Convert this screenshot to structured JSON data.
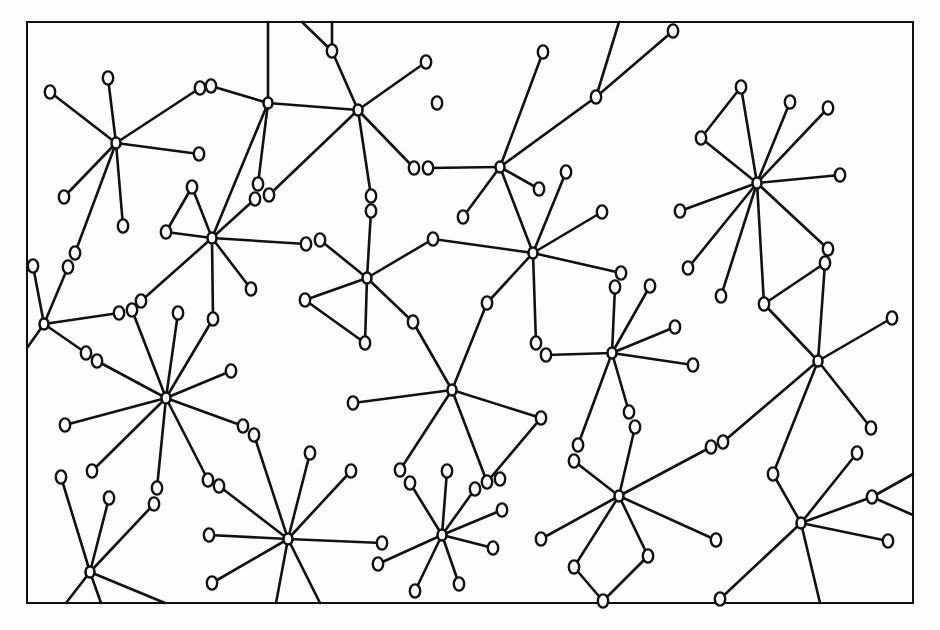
{
  "diagram": {
    "title": "",
    "type": "network-graph",
    "frame": {
      "x": 27,
      "y": 22,
      "width": 886,
      "height": 581
    },
    "colors": {
      "stroke": "#111111",
      "background": "#fdfdfd",
      "node_fill": "#ffffff"
    },
    "hubs": [
      {
        "id": "h1",
        "x": 116,
        "y": 143
      },
      {
        "id": "h2",
        "x": 268,
        "y": 103
      },
      {
        "id": "h3",
        "x": 358,
        "y": 110
      },
      {
        "id": "h4",
        "x": 212,
        "y": 238
      },
      {
        "id": "h5",
        "x": 44,
        "y": 324
      },
      {
        "id": "h6",
        "x": 367,
        "y": 278
      },
      {
        "id": "h7",
        "x": 500,
        "y": 167
      },
      {
        "id": "h8",
        "x": 533,
        "y": 253
      },
      {
        "id": "h9",
        "x": 757,
        "y": 183
      },
      {
        "id": "h10",
        "x": 166,
        "y": 398
      },
      {
        "id": "h11",
        "x": 452,
        "y": 390
      },
      {
        "id": "h12",
        "x": 612,
        "y": 353
      },
      {
        "id": "h13",
        "x": 818,
        "y": 361
      },
      {
        "id": "h14",
        "x": 90,
        "y": 572
      },
      {
        "id": "h15",
        "x": 288,
        "y": 539
      },
      {
        "id": "h16",
        "x": 442,
        "y": 535
      },
      {
        "id": "h17",
        "x": 619,
        "y": 496
      },
      {
        "id": "h18",
        "x": 801,
        "y": 523
      }
    ],
    "nodes": [
      {
        "x": 50,
        "y": 92
      },
      {
        "x": 108,
        "y": 78
      },
      {
        "x": 200,
        "y": 88
      },
      {
        "x": 211,
        "y": 86
      },
      {
        "x": 199,
        "y": 154
      },
      {
        "x": 64,
        "y": 197
      },
      {
        "x": 123,
        "y": 226
      },
      {
        "x": 332,
        "y": 51
      },
      {
        "x": 426,
        "y": 62
      },
      {
        "x": 437,
        "y": 103
      },
      {
        "x": 414,
        "y": 168
      },
      {
        "x": 428,
        "y": 168
      },
      {
        "x": 371,
        "y": 196
      },
      {
        "x": 371,
        "y": 211
      },
      {
        "x": 258,
        "y": 184
      },
      {
        "x": 255,
        "y": 199
      },
      {
        "x": 269,
        "y": 195
      },
      {
        "x": 192,
        "y": 187
      },
      {
        "x": 166,
        "y": 232
      },
      {
        "x": 306,
        "y": 244
      },
      {
        "x": 320,
        "y": 240
      },
      {
        "x": 251,
        "y": 289
      },
      {
        "x": 75,
        "y": 253
      },
      {
        "x": 68,
        "y": 267
      },
      {
        "x": 33,
        "y": 266
      },
      {
        "x": 119,
        "y": 313
      },
      {
        "x": 132,
        "y": 310
      },
      {
        "x": 141,
        "y": 301
      },
      {
        "x": 178,
        "y": 313
      },
      {
        "x": 213,
        "y": 319
      },
      {
        "x": 86,
        "y": 353
      },
      {
        "x": 97,
        "y": 361
      },
      {
        "x": 231,
        "y": 371
      },
      {
        "x": 65,
        "y": 425
      },
      {
        "x": 92,
        "y": 471
      },
      {
        "x": 243,
        "y": 426
      },
      {
        "x": 254,
        "y": 435
      },
      {
        "x": 157,
        "y": 488
      },
      {
        "x": 154,
        "y": 504
      },
      {
        "x": 208,
        "y": 480
      },
      {
        "x": 219,
        "y": 486
      },
      {
        "x": 61,
        "y": 477
      },
      {
        "x": 109,
        "y": 498
      },
      {
        "x": 305,
        "y": 300
      },
      {
        "x": 365,
        "y": 343
      },
      {
        "x": 433,
        "y": 239
      },
      {
        "x": 413,
        "y": 322
      },
      {
        "x": 543,
        "y": 52
      },
      {
        "x": 596,
        "y": 97
      },
      {
        "x": 673,
        "y": 31
      },
      {
        "x": 539,
        "y": 189
      },
      {
        "x": 463,
        "y": 217
      },
      {
        "x": 566,
        "y": 172
      },
      {
        "x": 602,
        "y": 212
      },
      {
        "x": 487,
        "y": 303
      },
      {
        "x": 621,
        "y": 273
      },
      {
        "x": 615,
        "y": 287
      },
      {
        "x": 536,
        "y": 343
      },
      {
        "x": 546,
        "y": 355
      },
      {
        "x": 650,
        "y": 286
      },
      {
        "x": 675,
        "y": 327
      },
      {
        "x": 693,
        "y": 365
      },
      {
        "x": 741,
        "y": 87
      },
      {
        "x": 701,
        "y": 138
      },
      {
        "x": 790,
        "y": 102
      },
      {
        "x": 828,
        "y": 108
      },
      {
        "x": 840,
        "y": 175
      },
      {
        "x": 680,
        "y": 211
      },
      {
        "x": 688,
        "y": 268
      },
      {
        "x": 721,
        "y": 296
      },
      {
        "x": 828,
        "y": 249
      },
      {
        "x": 825,
        "y": 263
      },
      {
        "x": 764,
        "y": 304
      },
      {
        "x": 892,
        "y": 318
      },
      {
        "x": 871,
        "y": 428
      },
      {
        "x": 723,
        "y": 442
      },
      {
        "x": 711,
        "y": 447
      },
      {
        "x": 353,
        "y": 403
      },
      {
        "x": 541,
        "y": 418
      },
      {
        "x": 400,
        "y": 470
      },
      {
        "x": 487,
        "y": 482
      },
      {
        "x": 629,
        "y": 412
      },
      {
        "x": 635,
        "y": 427
      },
      {
        "x": 578,
        "y": 445
      },
      {
        "x": 574,
        "y": 461
      },
      {
        "x": 310,
        "y": 453
      },
      {
        "x": 351,
        "y": 471
      },
      {
        "x": 209,
        "y": 535
      },
      {
        "x": 382,
        "y": 543
      },
      {
        "x": 212,
        "y": 583
      },
      {
        "x": 447,
        "y": 471
      },
      {
        "x": 410,
        "y": 483
      },
      {
        "x": 500,
        "y": 479
      },
      {
        "x": 475,
        "y": 489
      },
      {
        "x": 502,
        "y": 510
      },
      {
        "x": 378,
        "y": 564
      },
      {
        "x": 493,
        "y": 548
      },
      {
        "x": 415,
        "y": 591
      },
      {
        "x": 459,
        "y": 584
      },
      {
        "x": 541,
        "y": 539
      },
      {
        "x": 716,
        "y": 540
      },
      {
        "x": 574,
        "y": 567
      },
      {
        "x": 648,
        "y": 556
      },
      {
        "x": 603,
        "y": 601
      },
      {
        "x": 773,
        "y": 474
      },
      {
        "x": 857,
        "y": 453
      },
      {
        "x": 872,
        "y": 497
      },
      {
        "x": 888,
        "y": 541
      },
      {
        "x": 720,
        "y": 599
      }
    ],
    "edges": [
      [
        "h1",
        50,
        92
      ],
      [
        "h1",
        108,
        78
      ],
      [
        "h1",
        200,
        88
      ],
      [
        "h1",
        199,
        154
      ],
      [
        "h1",
        64,
        197
      ],
      [
        "h1",
        123,
        226
      ],
      [
        "h1",
        75,
        253
      ],
      [
        211,
        86,
        "h2"
      ],
      [
        "h2",
        268,
        22
      ],
      [
        "h2",
        "h3"
      ],
      [
        "h2",
        258,
        184
      ],
      [
        "h2",
        "h4"
      ],
      [
        "h3",
        332,
        51
      ],
      [
        "h3",
        426,
        62
      ],
      [
        "h3",
        414,
        168
      ],
      [
        "h3",
        371,
        196
      ],
      [
        "h3",
        269,
        195
      ],
      [
        332,
        51,
        302,
        22
      ],
      [
        332,
        51,
        332,
        22
      ],
      [
        "h4",
        192,
        187
      ],
      [
        "h4",
        166,
        232
      ],
      [
        192,
        187,
        166,
        232
      ],
      [
        "h4",
        306,
        244
      ],
      [
        "h4",
        251,
        289
      ],
      [
        "h4",
        213,
        319
      ],
      [
        "h4",
        141,
        301
      ],
      [
        "h4",
        255,
        199
      ],
      [
        68,
        267,
        "h5"
      ],
      [
        33,
        266,
        "h5"
      ],
      [
        "h5",
        27,
        348
      ],
      [
        "h5",
        119,
        313
      ],
      [
        "h5",
        86,
        353
      ],
      [
        320,
        240,
        "h6"
      ],
      [
        371,
        211,
        "h6"
      ],
      [
        "h6",
        433,
        239
      ],
      [
        "h6",
        305,
        300
      ],
      [
        305,
        300,
        365,
        343
      ],
      [
        "h6",
        365,
        343
      ],
      [
        "h6",
        413,
        322
      ],
      [
        413,
        322,
        "h11"
      ],
      [
        428,
        168,
        "h7"
      ],
      [
        "h7",
        543,
        52
      ],
      [
        "h7",
        596,
        97
      ],
      [
        596,
        97,
        673,
        31
      ],
      [
        596,
        97,
        619,
        22
      ],
      [
        "h7",
        539,
        189
      ],
      [
        "h7",
        463,
        217
      ],
      [
        "h7",
        "h8"
      ],
      [
        "h8",
        566,
        172
      ],
      [
        "h8",
        602,
        212
      ],
      [
        "h8",
        433,
        239
      ],
      [
        "h8",
        487,
        303
      ],
      [
        487,
        303,
        "h11"
      ],
      [
        "h8",
        621,
        273
      ],
      [
        "h8",
        536,
        343
      ],
      [
        546,
        355,
        "h12"
      ],
      [
        615,
        287,
        "h12"
      ],
      [
        "h12",
        650,
        286
      ],
      [
        "h12",
        675,
        327
      ],
      [
        "h12",
        693,
        365
      ],
      [
        "h12",
        629,
        412
      ],
      [
        "h12",
        578,
        445
      ],
      [
        "h9",
        741,
        87
      ],
      [
        741,
        87,
        701,
        138
      ],
      [
        "h9",
        701,
        138
      ],
      [
        "h9",
        790,
        102
      ],
      [
        "h9",
        828,
        108
      ],
      [
        "h9",
        840,
        175
      ],
      [
        "h9",
        680,
        211
      ],
      [
        "h9",
        688,
        268
      ],
      [
        "h9",
        721,
        296
      ],
      [
        "h9",
        828,
        249
      ],
      [
        "h9",
        764,
        304
      ],
      [
        825,
        263,
        764,
        304
      ],
      [
        825,
        263,
        "h13"
      ],
      [
        764,
        304,
        "h13"
      ],
      [
        "h13",
        892,
        318
      ],
      [
        "h13",
        871,
        428
      ],
      [
        "h13",
        723,
        442
      ],
      [
        "h13",
        773,
        474
      ],
      [
        "h10",
        178,
        313
      ],
      [
        "h10",
        132,
        310
      ],
      [
        "h10",
        97,
        361
      ],
      [
        "h10",
        213,
        319
      ],
      [
        "h10",
        231,
        371
      ],
      [
        "h10",
        65,
        425
      ],
      [
        "h10",
        92,
        471
      ],
      [
        "h10",
        243,
        426
      ],
      [
        "h10",
        157,
        488
      ],
      [
        "h10",
        208,
        480
      ],
      [
        "h11",
        353,
        403
      ],
      [
        "h11",
        541,
        418
      ],
      [
        541,
        418,
        487,
        482
      ],
      [
        "h11",
        400,
        470
      ],
      [
        "h11",
        487,
        482
      ],
      [
        "h14",
        61,
        477
      ],
      [
        "h14",
        109,
        498
      ],
      [
        "h14",
        154,
        504
      ],
      [
        "h14",
        66,
        603
      ],
      [
        "h14",
        101,
        603
      ],
      [
        "h14",
        165,
        603
      ],
      [
        254,
        435,
        "h15"
      ],
      [
        219,
        486,
        "h15"
      ],
      [
        "h15",
        310,
        453
      ],
      [
        "h15",
        351,
        471
      ],
      [
        "h15",
        209,
        535
      ],
      [
        "h15",
        382,
        543
      ],
      [
        "h15",
        212,
        583
      ],
      [
        "h15",
        276,
        603
      ],
      [
        "h15",
        320,
        603
      ],
      [
        "h16",
        447,
        471
      ],
      [
        "h16",
        410,
        483
      ],
      [
        "h16",
        475,
        489
      ],
      [
        "h16",
        502,
        510
      ],
      [
        "h16",
        378,
        564
      ],
      [
        "h16",
        493,
        548
      ],
      [
        "h16",
        415,
        591
      ],
      [
        "h16",
        459,
        584
      ],
      [
        574,
        461,
        "h17"
      ],
      [
        635,
        427,
        "h17"
      ],
      [
        711,
        447,
        "h17"
      ],
      [
        "h17",
        541,
        539
      ],
      [
        "h17",
        716,
        540
      ],
      [
        "h17",
        574,
        567
      ],
      [
        "h17",
        648,
        556
      ],
      [
        574,
        567,
        603,
        601
      ],
      [
        648,
        556,
        603,
        601
      ],
      [
        773,
        474,
        "h18"
      ],
      [
        "h18",
        857,
        453
      ],
      [
        "h18",
        872,
        497
      ],
      [
        "h18",
        888,
        541
      ],
      [
        "h18",
        720,
        599
      ],
      [
        "h18",
        820,
        603
      ],
      [
        872,
        497,
        913,
        474
      ],
      [
        872,
        497,
        913,
        515
      ]
    ]
  }
}
